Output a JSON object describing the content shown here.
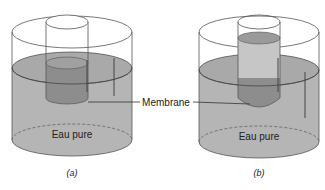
{
  "diagram": {
    "labels": {
      "membrane": "Membrane",
      "water_a": "Eau pure",
      "water_b": "Eau pure",
      "caption_a": "(a)",
      "caption_b": "(b)"
    },
    "colors": {
      "water": "#b5b5b5",
      "water_top": "#a9a9a9",
      "solution": "#8d8d8d",
      "solution_light": "#c6c6c6",
      "outline": "#555555",
      "background": "#ffffff"
    }
  }
}
